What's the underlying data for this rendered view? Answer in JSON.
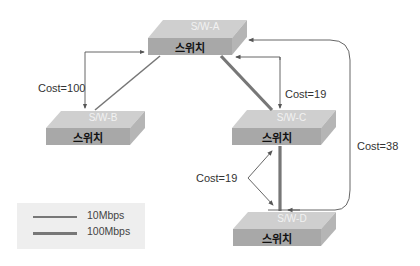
{
  "diagram": {
    "switches": [
      {
        "id": "A",
        "name": "S/W-A",
        "label": "스위치"
      },
      {
        "id": "B",
        "name": "S/W-B",
        "label": "스위치"
      },
      {
        "id": "C",
        "name": "S/W-C",
        "label": "스위치"
      },
      {
        "id": "D",
        "name": "S/W-D",
        "label": "스위치"
      }
    ],
    "costs": [
      {
        "path": "A-B",
        "label": "Cost=100"
      },
      {
        "path": "A-C",
        "label": "Cost=19"
      },
      {
        "path": "C-D",
        "label": "Cost=19"
      },
      {
        "path": "A-D",
        "label": "Cost=38"
      }
    ],
    "links": [
      {
        "from": "A",
        "to": "B",
        "speed": "10Mbps"
      },
      {
        "from": "A",
        "to": "C",
        "speed": "100Mbps"
      },
      {
        "from": "C",
        "to": "D",
        "speed": "100Mbps"
      }
    ],
    "legend": [
      {
        "label": "10Mbps",
        "color": "#777777",
        "width": 1.5
      },
      {
        "label": "100Mbps",
        "color": "#777777",
        "width": 3
      }
    ],
    "colors": {
      "switch_top": "#c8c8c8",
      "switch_front": "#a9a9a9",
      "switch_side": "#b8b8b8",
      "line": "#666666"
    }
  }
}
